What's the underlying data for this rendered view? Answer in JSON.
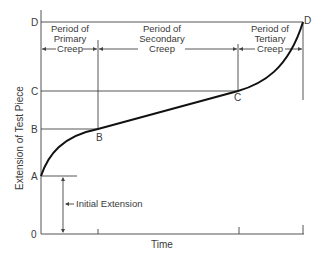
{
  "diagram": {
    "y_axis_label": "Extension of Test Piece",
    "x_axis_label": "Time",
    "y_ticks": [
      "D",
      "C",
      "B",
      "A",
      "0"
    ],
    "point_labels": {
      "B": "B",
      "C": "C",
      "D": "D"
    },
    "periods": [
      {
        "line1": "Period of",
        "line2": "Primary",
        "line3": "Creep"
      },
      {
        "line1": "Period of",
        "line2": "Secondary",
        "line3": "Creep"
      },
      {
        "line1": "Period of",
        "line2": "Tertiary",
        "line3": "Creep"
      }
    ],
    "initial_extension_label": "Initial Extension",
    "colors": {
      "curve": "#111111",
      "lines": "#444444",
      "text": "#3a3a3a"
    }
  }
}
